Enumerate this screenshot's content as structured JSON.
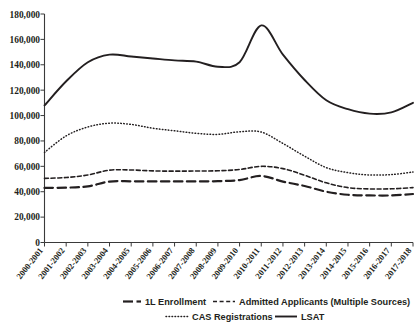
{
  "chart_data": {
    "type": "line",
    "title": "",
    "subtitle": "",
    "xlabel": "",
    "ylabel": "",
    "grid": false,
    "ylim": [
      0,
      180000
    ],
    "ytick_labels": [
      "180,000",
      "160,000",
      "140,000",
      "120,000",
      "100,000",
      "80,000",
      "60,000",
      "40,000",
      "20,000",
      "0"
    ],
    "ytick_values": [
      180000,
      160000,
      140000,
      120000,
      100000,
      80000,
      60000,
      40000,
      20000,
      0
    ],
    "legend_position": "bottom",
    "categories": [
      "2000-2001",
      "2001-2002",
      "2002-2003",
      "2003-2004",
      "2004-2005",
      "2005-2006",
      "2006-2007",
      "2007-2008",
      "2008-2009",
      "2009-2010",
      "2010-2011",
      "2011-2012",
      "2012-2013",
      "2013-2014",
      "2014-2015",
      "2015-2016",
      "2016-2017",
      "2017-2018"
    ],
    "series": [
      {
        "name": "1L Enrollment",
        "style": "long-dash",
        "values": [
          43000,
          43200,
          44200,
          48000,
          48200,
          48100,
          48100,
          48100,
          48300,
          49200,
          52400,
          48000,
          44500,
          40000,
          37600,
          37100,
          37100,
          38200
        ]
      },
      {
        "name": "Admitted Applicants (Multiple Sources)",
        "style": "short-dash",
        "values": [
          50500,
          51200,
          53200,
          57000,
          57100,
          56400,
          56200,
          56300,
          56500,
          57500,
          60000,
          58200,
          53000,
          47000,
          43200,
          42200,
          42300,
          43200
        ]
      },
      {
        "name": "CAS Registrations",
        "style": "dotted",
        "values": [
          71000,
          84000,
          91000,
          94000,
          93000,
          90000,
          88000,
          86000,
          85200,
          87200,
          87000,
          78000,
          68000,
          59000,
          55000,
          53200,
          53500,
          55500
        ]
      },
      {
        "name": "LSAT",
        "style": "solid",
        "values": [
          108000,
          127000,
          142000,
          148000,
          146500,
          145000,
          143500,
          142500,
          138500,
          142000,
          171000,
          148000,
          128000,
          112000,
          105000,
          101500,
          102500,
          110000
        ]
      }
    ]
  },
  "legend": {
    "items": [
      {
        "label": "1L Enrollment",
        "style": "long-dash"
      },
      {
        "label": "Admitted Applicants (Multiple Sources)",
        "style": "short-dash"
      },
      {
        "label": "CAS Registrations",
        "style": "dotted"
      },
      {
        "label": "LSAT",
        "style": "solid"
      }
    ]
  },
  "colors": {
    "ink": "#231f20",
    "axis": "#3a3a3a",
    "background": "#ffffff"
  }
}
